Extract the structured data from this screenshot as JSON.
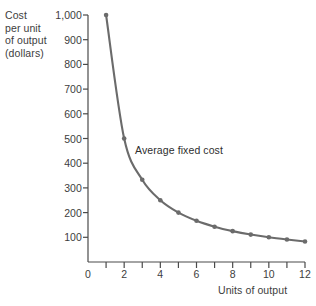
{
  "chart_data": {
    "type": "line",
    "title": "",
    "xlabel": "Units of output",
    "ylabel": "Cost\nper unit\nof output\n(dollars)",
    "series_label": "Average fixed cost",
    "x": [
      1,
      2,
      3,
      4,
      5,
      6,
      7,
      8,
      9,
      10,
      11,
      12
    ],
    "values": [
      1000,
      500,
      333,
      250,
      200,
      167,
      143,
      125,
      111,
      100,
      91,
      83
    ],
    "xlim": [
      0,
      12
    ],
    "ylim": [
      0,
      1000
    ],
    "x_ticks": [
      1,
      2,
      3,
      4,
      5,
      6,
      7,
      8,
      9,
      10,
      11,
      12
    ],
    "x_tick_labels": [
      "0",
      "2",
      "4",
      "6",
      "8",
      "10",
      "12"
    ],
    "x_labeled_values": [
      0,
      2,
      4,
      6,
      8,
      10,
      12
    ],
    "y_ticks": [
      100,
      200,
      300,
      400,
      500,
      600,
      700,
      800,
      900,
      1000
    ],
    "y_tick_labels": [
      "100",
      "200",
      "300",
      "400",
      "500",
      "600",
      "700",
      "800",
      "900",
      "1,000"
    ],
    "grid": false,
    "legend": "none",
    "marker": "circle",
    "line_color": "#6b6b6b",
    "marker_color": "#6b6b6b",
    "axis_color": "#4a4a4a",
    "background": "#ffffff"
  },
  "axes": {
    "y_title": "Cost\nper unit\nof output\n(dollars)",
    "x_title": "Units of output"
  },
  "annotation": {
    "text": "Average fixed cost"
  }
}
